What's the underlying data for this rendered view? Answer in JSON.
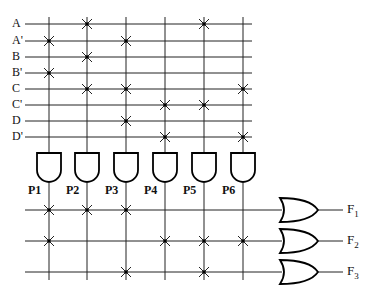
{
  "colors": {
    "line": "#222222",
    "background": "#ffffff"
  },
  "inputs": [
    {
      "label": "A",
      "y": 24
    },
    {
      "label": "A'",
      "y": 41
    },
    {
      "label": "B",
      "y": 57
    },
    {
      "label": "B'",
      "y": 73
    },
    {
      "label": "C",
      "y": 89
    },
    {
      "label": "C'",
      "y": 105
    },
    {
      "label": "D",
      "y": 121
    },
    {
      "label": "D'",
      "y": 137
    }
  ],
  "product_terms": [
    {
      "label": "P1",
      "x": 49,
      "inputs": [
        "A'",
        "B'"
      ]
    },
    {
      "label": "P2",
      "x": 87,
      "inputs": [
        "A",
        "B",
        "C"
      ]
    },
    {
      "label": "P3",
      "x": 126,
      "inputs": [
        "A'",
        "C",
        "D"
      ]
    },
    {
      "label": "P4",
      "x": 165,
      "inputs": [
        "C'",
        "D'"
      ]
    },
    {
      "label": "P5",
      "x": 204,
      "inputs": [
        "A",
        "C'"
      ]
    },
    {
      "label": "P6",
      "x": 243,
      "inputs": [
        "C",
        "D'"
      ]
    }
  ],
  "outputs": [
    {
      "label": "F",
      "sub": "1",
      "y": 210,
      "terms": [
        "P1",
        "P2",
        "P3"
      ]
    },
    {
      "label": "F",
      "sub": "2",
      "y": 241,
      "terms": [
        "P1",
        "P4",
        "P5",
        "P6"
      ]
    },
    {
      "label": "F",
      "sub": "3",
      "y": 272,
      "terms": [
        "P3",
        "P5"
      ]
    }
  ]
}
